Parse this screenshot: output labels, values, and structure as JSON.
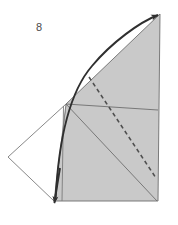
{
  "figure": {
    "label": "8",
    "label_position": {
      "x": 36,
      "y": 22
    },
    "canvas": {
      "width": 178,
      "height": 225
    },
    "colors": {
      "background": "#ffffff",
      "shaded_fill": "#c9c9c9",
      "outline_stroke": "#6e6e6e",
      "thin_stroke": "#7a7a7a",
      "heavy_stroke": "#3d3d3d",
      "dashed_stroke": "#4f4f4f",
      "label_color": "#4a4a4a"
    },
    "elements": [
      {
        "name": "shaded-quadrilateral",
        "kind": "filled-polygon",
        "points": "66,104 160,14 158,201 54,201"
      },
      {
        "name": "left-white-triangle",
        "kind": "outline-polygon",
        "points": "66,104 8,157 54,201"
      },
      {
        "name": "horizontal-divider-line",
        "kind": "line",
        "from": {
          "x": 66,
          "y": 104
        },
        "to": {
          "x": 158,
          "y": 110
        }
      },
      {
        "name": "inner-diagonal-line",
        "kind": "line",
        "from": {
          "x": 66,
          "y": 104
        },
        "to": {
          "x": 157,
          "y": 201
        }
      },
      {
        "name": "inner-vertical-line",
        "kind": "line",
        "from": {
          "x": 63,
          "y": 106
        },
        "to": {
          "x": 62,
          "y": 201
        }
      },
      {
        "name": "dashed-diagonal-line",
        "kind": "dashed-line",
        "from": {
          "x": 89,
          "y": 77
        },
        "to": {
          "x": 156,
          "y": 178
        }
      },
      {
        "name": "curved-arrow-path",
        "kind": "curve-with-arrowheads",
        "start": {
          "x": 54,
          "y": 204
        },
        "end": {
          "x": 161,
          "y": 13
        },
        "control": {
          "x": 60,
          "y": 62
        },
        "arrowheads": [
          "start",
          "end"
        ]
      }
    ]
  }
}
